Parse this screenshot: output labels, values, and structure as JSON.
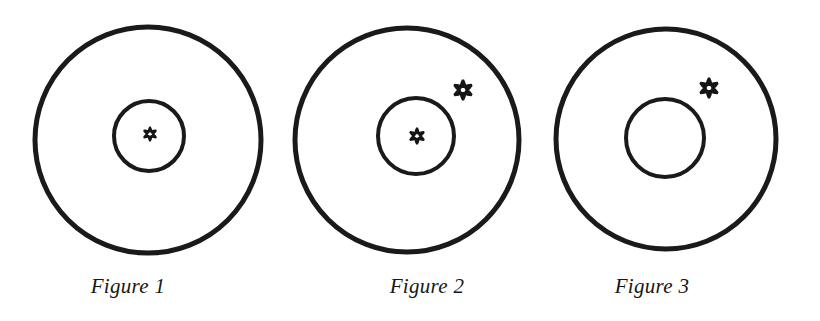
{
  "document": {
    "type": "figure-plate",
    "background_color": "#ffffff",
    "ink_color": "#1a1a1a",
    "width": 820,
    "height": 321
  },
  "figures": [
    {
      "id": "figure-1",
      "caption": "Figure 1",
      "caption_center_x": 128,
      "caption_baseline_y": 297,
      "outer_circle": {
        "cx": 148,
        "cy": 140,
        "r": 113,
        "stroke_width": 5
      },
      "inner_circle": {
        "cx": 149,
        "cy": 136,
        "r": 35,
        "stroke_width": 4
      },
      "asterisks": [
        {
          "name": "asterisk-inner",
          "cx": 150,
          "cy": 134,
          "size": 15,
          "region": "inner-circle"
        }
      ]
    },
    {
      "id": "figure-2",
      "caption": "Figure 2",
      "caption_center_x": 427,
      "caption_baseline_y": 297,
      "outer_circle": {
        "cx": 407,
        "cy": 140,
        "r": 112,
        "stroke_width": 5
      },
      "inner_circle": {
        "cx": 416,
        "cy": 136,
        "r": 38,
        "stroke_width": 4
      },
      "asterisks": [
        {
          "name": "asterisk-inner",
          "cx": 417,
          "cy": 136,
          "size": 17,
          "region": "inner-circle"
        },
        {
          "name": "asterisk-annulus",
          "cx": 463,
          "cy": 90,
          "size": 21,
          "region": "annulus"
        }
      ]
    },
    {
      "id": "figure-3",
      "caption": "Figure 3",
      "caption_center_x": 652,
      "caption_baseline_y": 297,
      "outer_circle": {
        "cx": 666,
        "cy": 139,
        "r": 110,
        "stroke_width": 5
      },
      "inner_circle": {
        "cx": 665,
        "cy": 138,
        "r": 39,
        "stroke_width": 4
      },
      "asterisks": [
        {
          "name": "asterisk-annulus",
          "cx": 709,
          "cy": 88,
          "size": 21,
          "region": "annulus"
        }
      ]
    }
  ],
  "captions": {
    "figure_1": "Figure 1",
    "figure_2": "Figure 2",
    "figure_3": "Figure 3"
  }
}
